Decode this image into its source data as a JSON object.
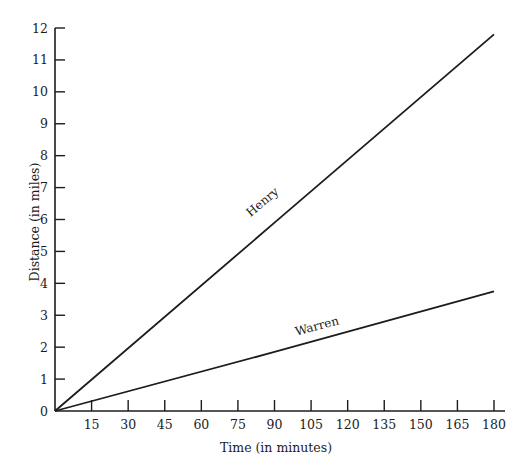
{
  "chart_data": {
    "type": "line",
    "title": "",
    "xlabel": "Time (in minutes)",
    "ylabel": "Distance (in miles)",
    "xlim": [
      0,
      180
    ],
    "ylim": [
      0,
      12
    ],
    "x_ticks": [
      15,
      30,
      45,
      60,
      75,
      90,
      105,
      120,
      135,
      150,
      165,
      180
    ],
    "y_ticks": [
      0,
      1,
      2,
      3,
      4,
      5,
      6,
      7,
      8,
      9,
      10,
      11,
      12
    ],
    "grid": false,
    "legend": "none (series labeled inline on lines)",
    "series": [
      {
        "name": "Henry",
        "x": [
          0,
          90,
          180
        ],
        "y": [
          0,
          5.9,
          11.8
        ]
      },
      {
        "name": "Warren",
        "x": [
          0,
          90,
          180
        ],
        "y": [
          0,
          1.85,
          3.75
        ]
      }
    ]
  },
  "style": {
    "line_color": "#1c1c1c",
    "axis_color": "#1c1c1c",
    "background": "#ffffff"
  }
}
